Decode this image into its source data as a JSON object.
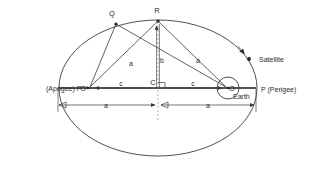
{
  "diagram": {
    "colors": {
      "ellipse_stroke": "#3c3c3c",
      "ray_stroke": "#3a3a3a",
      "axis_stroke": "#555555",
      "label_fill": "#2b2b2b",
      "background": "#ffffff"
    },
    "points": [
      {
        "id": "Q",
        "label": "Q",
        "x": 116,
        "y": 24,
        "label_x": 113,
        "label_y": 15,
        "marker": "dot"
      },
      {
        "id": "R",
        "label": "R",
        "x": 158,
        "y": 21,
        "label_x": 155,
        "label_y": 12,
        "marker": "dot"
      },
      {
        "id": "O_prime",
        "label": "O'",
        "x": 88,
        "y": 88,
        "label_x": 80,
        "label_y": 88,
        "marker": "none"
      },
      {
        "id": "C",
        "label": "C",
        "x": 158,
        "y": 88,
        "label_x": 153,
        "label_y": 85,
        "marker": "none"
      },
      {
        "id": "O",
        "label": "O",
        "x": 228,
        "y": 88,
        "label_x": 231,
        "label_y": 88,
        "marker": "none"
      },
      {
        "id": "P_prime",
        "label": "P'",
        "x": 58,
        "y": 88,
        "label_x": 46,
        "label_y": 90,
        "marker": "none"
      },
      {
        "id": "P",
        "label": "P",
        "x": 256,
        "y": 88,
        "label_x": 260,
        "label_y": 90,
        "marker": "none"
      },
      {
        "id": "Satellite",
        "label": "Satellite",
        "x": 249,
        "y": 59,
        "label_x": 258,
        "label_y": 61,
        "marker": "dot"
      }
    ],
    "annotations": {
      "apogee_label": "(Apogee) P'",
      "perigee_label": "P (Perigee)",
      "satellite_label": "Satellite",
      "earth_label": "Earth",
      "focus_left_label": "O'",
      "focus_right_label": "O",
      "center_label": "C",
      "vertex_q_label": "Q",
      "vertex_r_label": "R"
    },
    "segments": [
      {
        "id": "Q-Oprime",
        "label": "",
        "from": "Q",
        "to": "O_prime"
      },
      {
        "id": "Q-O",
        "label": "a",
        "from": "Q",
        "to": "O",
        "label_x": 130,
        "label_y": 65
      },
      {
        "id": "R-Oprime",
        "label": "",
        "from": "R",
        "to": "O_prime"
      },
      {
        "id": "R-O",
        "label": "a",
        "from": "R",
        "to": "O",
        "label_x": 197,
        "label_y": 62
      },
      {
        "id": "R-C",
        "label": "b",
        "from": "R",
        "to": "C",
        "label_x": 161,
        "label_y": 62
      },
      {
        "id": "Oprime-C",
        "label": "c",
        "from": "O_prime",
        "to": "C",
        "label_x": 120,
        "label_y": 86
      },
      {
        "id": "C-O",
        "label": "c",
        "from": "C",
        "to": "O",
        "label_x": 192,
        "label_y": 86
      },
      {
        "id": "Pprime-C",
        "label": "a",
        "from": "P_prime",
        "to": "C",
        "label_x": 105,
        "label_y": 107
      },
      {
        "id": "C-P",
        "label": "a",
        "from": "C",
        "to": "P",
        "label_x": 207,
        "label_y": 107
      }
    ],
    "labels": {
      "semi_major": "a",
      "semi_minor": "b",
      "focal_distance": "c"
    },
    "ellipse": {
      "center_x": 158,
      "center_y": 88,
      "semi_major_px": 99,
      "semi_minor_px": 68
    }
  }
}
